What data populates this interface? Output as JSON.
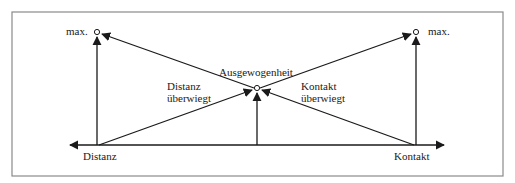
{
  "diagram": {
    "labels": {
      "max_left": "max.",
      "max_right": "max.",
      "balance": "Ausgewogenheit",
      "distance_dominates_1": "Distanz",
      "distance_dominates_2": "überwiegt",
      "contact_dominates_1": "Kontakt",
      "contact_dominates_2": "überwiegt",
      "axis_left": "Distanz",
      "axis_right": "Kontakt"
    },
    "colors": {
      "line": "#1a1a1a",
      "frame": "#8a8a8a"
    }
  }
}
